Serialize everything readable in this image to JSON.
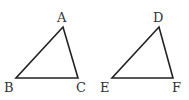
{
  "diagram": {
    "title": "",
    "stroke_color": "#222222",
    "label_color": "#333333",
    "triangles": [
      {
        "name": "ABC",
        "vertices": [
          {
            "label": "A",
            "x": 63,
            "y": 27,
            "label_x": 57,
            "label_y": 22
          },
          {
            "label": "B",
            "x": 16,
            "y": 78,
            "label_x": 4,
            "label_y": 92
          },
          {
            "label": "C",
            "x": 78,
            "y": 78,
            "label_x": 76,
            "label_y": 92
          }
        ]
      },
      {
        "name": "DEF",
        "vertices": [
          {
            "label": "D",
            "x": 159,
            "y": 27,
            "label_x": 153,
            "label_y": 22
          },
          {
            "label": "E",
            "x": 112,
            "y": 78,
            "label_x": 100,
            "label_y": 92
          },
          {
            "label": "F",
            "x": 173,
            "y": 78,
            "label_x": 172,
            "label_y": 92
          }
        ]
      }
    ]
  }
}
